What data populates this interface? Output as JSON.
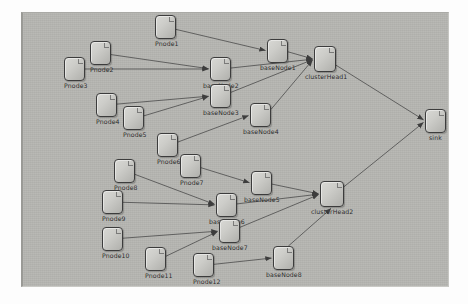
{
  "diagram": {
    "canvas": {
      "background_color": "#b6b6b2",
      "border_color": "#9a9a96",
      "x": 21,
      "y": 12,
      "width": 428,
      "height": 275
    },
    "node_style": {
      "fill_start": "#d8d8d4",
      "fill_end": "#b0b0ac",
      "border_color": "#3c3c3c",
      "label_color": "#262626"
    },
    "edge_style": {
      "color": "#4a4a4a",
      "width": 0.8,
      "arrowhead": "filled-triangle"
    },
    "nodes": [
      {
        "id": "Pnode1",
        "label": "Pnode1",
        "x": 132,
        "y": 2,
        "w": 21,
        "h": 24,
        "label_dx": 0,
        "label_dy": 25
      },
      {
        "id": "Pnode2",
        "label": "Pnode2",
        "x": 67,
        "y": 28,
        "w": 21,
        "h": 24,
        "label_dx": 0,
        "label_dy": 25
      },
      {
        "id": "Pnode3",
        "label": "Pnode3",
        "x": 41,
        "y": 44,
        "w": 21,
        "h": 24,
        "label_dx": 0,
        "label_dy": 25
      },
      {
        "id": "Pnode4",
        "label": "Pnode4",
        "x": 73,
        "y": 80,
        "w": 21,
        "h": 24,
        "label_dx": 0,
        "label_dy": 25
      },
      {
        "id": "Pnode5",
        "label": "Pnode5",
        "x": 100,
        "y": 93,
        "w": 21,
        "h": 24,
        "label_dx": 0,
        "label_dy": 25
      },
      {
        "id": "Pnode6",
        "label": "Pnode6",
        "x": 134,
        "y": 120,
        "w": 21,
        "h": 24,
        "label_dx": 0,
        "label_dy": 25
      },
      {
        "id": "Pnode7",
        "label": "Pnode7",
        "x": 157,
        "y": 141,
        "w": 21,
        "h": 24,
        "label_dx": 0,
        "label_dy": 25
      },
      {
        "id": "Pnode8",
        "label": "Pnode8",
        "x": 91,
        "y": 146,
        "w": 21,
        "h": 24,
        "label_dx": 0,
        "label_dy": 25
      },
      {
        "id": "Pnode9",
        "label": "Pnode9",
        "x": 79,
        "y": 177,
        "w": 21,
        "h": 24,
        "label_dx": 0,
        "label_dy": 25
      },
      {
        "id": "Pnode10",
        "label": "Pnode10",
        "x": 79,
        "y": 214,
        "w": 21,
        "h": 24,
        "label_dx": 0,
        "label_dy": 25
      },
      {
        "id": "Pnode11",
        "label": "Pnode11",
        "x": 122,
        "y": 234,
        "w": 21,
        "h": 24,
        "label_dx": 0,
        "label_dy": 25
      },
      {
        "id": "Pnode12",
        "label": "Pnode12",
        "x": 170,
        "y": 240,
        "w": 21,
        "h": 24,
        "label_dx": 0,
        "label_dy": 25
      },
      {
        "id": "baseNode1",
        "label": "baseNode1",
        "x": 244,
        "y": 26,
        "w": 21,
        "h": 24,
        "label_dx": -7,
        "label_dy": 25
      },
      {
        "id": "baseNode2",
        "label": "baseNode2",
        "x": 187,
        "y": 44,
        "w": 21,
        "h": 24,
        "label_dx": -7,
        "label_dy": 25
      },
      {
        "id": "baseNode3",
        "label": "baseNode3",
        "x": 187,
        "y": 71,
        "w": 21,
        "h": 24,
        "label_dx": -7,
        "label_dy": 25
      },
      {
        "id": "baseNode4",
        "label": "baseNode4",
        "x": 227,
        "y": 90,
        "w": 21,
        "h": 24,
        "label_dx": -7,
        "label_dy": 25
      },
      {
        "id": "baseNode5",
        "label": "baseNode5",
        "x": 228,
        "y": 158,
        "w": 21,
        "h": 24,
        "label_dx": -7,
        "label_dy": 25
      },
      {
        "id": "baseNode6",
        "label": "baseNode6",
        "x": 193,
        "y": 180,
        "w": 21,
        "h": 24,
        "label_dx": -7,
        "label_dy": 25
      },
      {
        "id": "baseNode7",
        "label": "baseNode7",
        "x": 196,
        "y": 206,
        "w": 21,
        "h": 24,
        "label_dx": -7,
        "label_dy": 25
      },
      {
        "id": "baseNode8",
        "label": "baseNode8",
        "x": 250,
        "y": 233,
        "w": 21,
        "h": 24,
        "label_dx": -7,
        "label_dy": 25
      },
      {
        "id": "clusterHead1",
        "label": "clusterHead1",
        "x": 291,
        "y": 33,
        "w": 22,
        "h": 26,
        "label_dx": -9,
        "label_dy": 27
      },
      {
        "id": "clusterHead2",
        "label": "clusterHead2",
        "x": 297,
        "y": 168,
        "w": 24,
        "h": 26,
        "label_dx": -9,
        "label_dy": 27
      },
      {
        "id": "sink",
        "label": "sink",
        "x": 402,
        "y": 96,
        "w": 21,
        "h": 24,
        "label_dx": 4,
        "label_dy": 25
      }
    ],
    "edges": [
      {
        "from": "Pnode1",
        "to": "baseNode1"
      },
      {
        "from": "Pnode2",
        "to": "baseNode2"
      },
      {
        "from": "Pnode3",
        "to": "baseNode2"
      },
      {
        "from": "Pnode4",
        "to": "baseNode3"
      },
      {
        "from": "Pnode5",
        "to": "baseNode3"
      },
      {
        "from": "Pnode6",
        "to": "baseNode4"
      },
      {
        "from": "baseNode1",
        "to": "clusterHead1"
      },
      {
        "from": "baseNode2",
        "to": "clusterHead1"
      },
      {
        "from": "baseNode3",
        "to": "clusterHead1"
      },
      {
        "from": "baseNode4",
        "to": "clusterHead1"
      },
      {
        "from": "Pnode7",
        "to": "baseNode5"
      },
      {
        "from": "Pnode8",
        "to": "baseNode6"
      },
      {
        "from": "Pnode9",
        "to": "baseNode6"
      },
      {
        "from": "Pnode10",
        "to": "baseNode7"
      },
      {
        "from": "Pnode11",
        "to": "baseNode7"
      },
      {
        "from": "Pnode12",
        "to": "baseNode8"
      },
      {
        "from": "baseNode5",
        "to": "clusterHead2"
      },
      {
        "from": "baseNode6",
        "to": "clusterHead2"
      },
      {
        "from": "baseNode7",
        "to": "clusterHead2"
      },
      {
        "from": "baseNode8",
        "to": "clusterHead2"
      },
      {
        "from": "clusterHead1",
        "to": "sink"
      },
      {
        "from": "clusterHead2",
        "to": "sink"
      }
    ]
  }
}
